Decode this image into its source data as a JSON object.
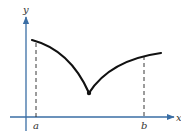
{
  "figure": {
    "type": "function-graph",
    "axes": {
      "x_label": "x",
      "y_label": "y",
      "axis_color": "#3a6ea5"
    },
    "interval": {
      "left_label": "a",
      "right_label": "b"
    },
    "curve": {
      "color": "#111111",
      "start_point": [
        32,
        40
      ],
      "cusp_point": [
        89,
        93
      ],
      "end_point": [
        161,
        53
      ]
    },
    "dashed_guides": [
      {
        "x": 36,
        "label": "a"
      },
      {
        "x": 144,
        "label": "b"
      }
    ]
  }
}
